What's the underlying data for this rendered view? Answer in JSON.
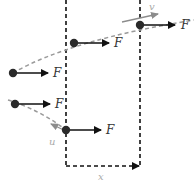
{
  "diagram": {
    "force_label": "F",
    "velocity_label": "v",
    "initial_velocity_label": "u",
    "displacement_label": "x",
    "colors": {
      "ink": "#111111",
      "ball": "#2a2a2a",
      "curve": "#9a9a9a",
      "velocity_arrow": "#8c8c8c"
    },
    "upper_trajectory": {
      "points": [
        {
          "x": 13,
          "y": 73,
          "force": "F"
        },
        {
          "x": 74,
          "y": 43,
          "force": "F"
        },
        {
          "x": 140,
          "y": 25,
          "force": "F"
        }
      ]
    },
    "lower_trajectory": {
      "points": [
        {
          "x": 13,
          "y": 104,
          "force": "F"
        },
        {
          "x": 66,
          "y": 130,
          "force": "F"
        }
      ]
    }
  }
}
